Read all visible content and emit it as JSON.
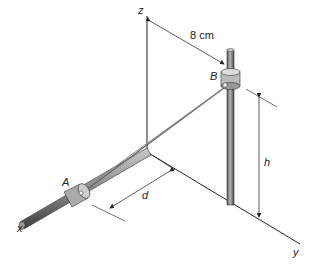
{
  "figure": {
    "axes": {
      "x": "x",
      "y": "y",
      "z": "z"
    },
    "points": {
      "A": "A",
      "B": "B"
    },
    "dimensions": {
      "horizontal_offset": "8 cm",
      "distance": "d",
      "height": "h"
    },
    "colors": {
      "rod": "#8a8a8a",
      "rod_dark": "#555555",
      "collar": "#b8b8b8",
      "line": "#222222",
      "cord": "#777777"
    }
  }
}
